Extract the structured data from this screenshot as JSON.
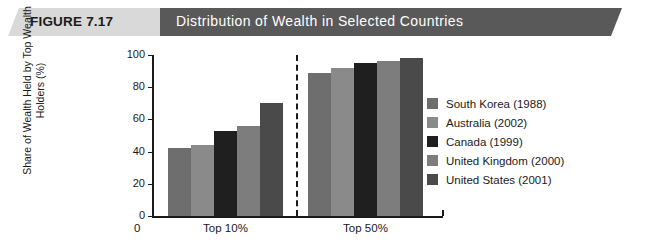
{
  "banner": {
    "figure_number": "FIGURE 7.17",
    "title": "Distribution of Wealth in Selected Countries",
    "light_color": "#d9d9d9",
    "dark_color": "#595959"
  },
  "chart_data": {
    "type": "bar",
    "title": "Distribution of Wealth in Selected Countries",
    "xlabel": "",
    "ylabel": "Share of Wealth Held by Top Wealth Holders (%)",
    "categories": [
      "Top 10%",
      "Top 50%"
    ],
    "ylim": [
      0,
      100
    ],
    "yticks": [
      0,
      20,
      40,
      60,
      80,
      100
    ],
    "grid": false,
    "legend_position": "right",
    "series": [
      {
        "name": "South Korea (1988)",
        "color": "#6e6e6e",
        "values": [
          42,
          89
        ]
      },
      {
        "name": "Australia (2002)",
        "color": "#8a8a8a",
        "values": [
          44,
          92
        ]
      },
      {
        "name": "Canada (1999)",
        "color": "#1f1f1f",
        "values": [
          53,
          95
        ]
      },
      {
        "name": "United Kingdom (2000)",
        "color": "#7d7d7d",
        "values": [
          56,
          96
        ]
      },
      {
        "name": "United States (2001)",
        "color": "#4a4a4a",
        "values": [
          70,
          98
        ]
      }
    ],
    "annotations": {
      "zero_origin_label": "0",
      "group_divider": "dashed vertical line between Top 10% and Top 50%"
    }
  }
}
